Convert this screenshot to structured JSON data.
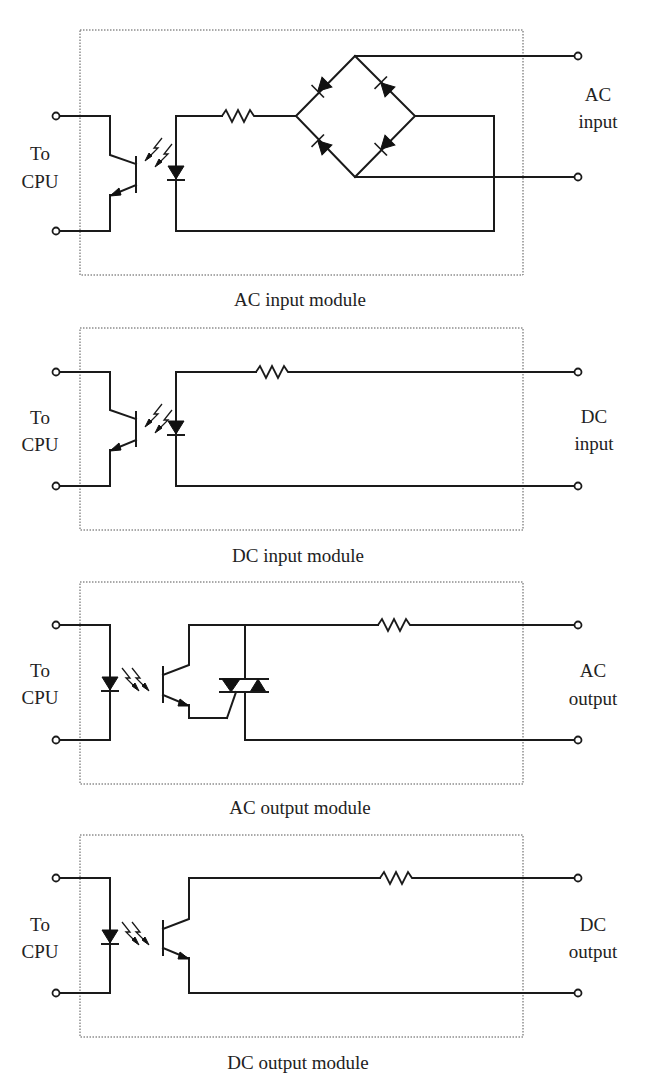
{
  "figure": {
    "modules": [
      {
        "id": "ac-input",
        "caption": "AC input module",
        "left_label": [
          "To",
          "CPU"
        ],
        "right_label": [
          "AC",
          "input"
        ],
        "components": [
          "phototransistor",
          "LED",
          "resistor",
          "bridge-rectifier"
        ]
      },
      {
        "id": "dc-input",
        "caption": "DC input module",
        "left_label": [
          "To",
          "CPU"
        ],
        "right_label": [
          "DC",
          "input"
        ],
        "components": [
          "phototransistor",
          "LED",
          "resistor"
        ]
      },
      {
        "id": "ac-output",
        "caption": "AC output module",
        "left_label": [
          "To",
          "CPU"
        ],
        "right_label": [
          "AC",
          "output"
        ],
        "components": [
          "LED",
          "phototransistor",
          "triac",
          "resistor"
        ]
      },
      {
        "id": "dc-output",
        "caption": "DC output module",
        "left_label": [
          "To",
          "CPU"
        ],
        "right_label": [
          "DC",
          "output"
        ],
        "components": [
          "LED",
          "phototransistor",
          "resistor"
        ]
      }
    ]
  },
  "colors": {
    "wire": "#1a1a1a",
    "box_border": "#555555",
    "text": "#222222",
    "background": "#ffffff"
  }
}
